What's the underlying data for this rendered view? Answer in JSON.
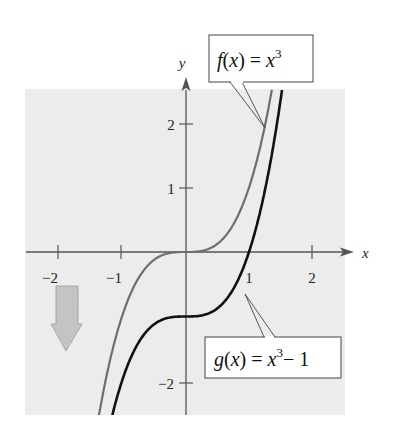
{
  "chart_data": {
    "type": "line",
    "title": "",
    "xlabel": "x",
    "ylabel": "y",
    "xlim": [
      -2.5,
      2.5
    ],
    "ylim": [
      -2.55,
      2.55
    ],
    "grid": false,
    "x_ticks": [
      -2,
      -1,
      1,
      2
    ],
    "x_tick_labels": [
      "−2",
      "−1",
      "1",
      "2"
    ],
    "y_ticks": [
      -2,
      1,
      2
    ],
    "y_tick_labels": [
      "−2",
      "1",
      "2"
    ],
    "series": [
      {
        "name": "f(x) = x^3",
        "color": "#6e6e6e",
        "x": [
          -1.4,
          -1.2,
          -1.0,
          -0.8,
          -0.6,
          -0.4,
          -0.2,
          0,
          0.2,
          0.4,
          0.6,
          0.8,
          1.0,
          1.2,
          1.36
        ],
        "values": [
          -2.744,
          -1.728,
          -1.0,
          -0.512,
          -0.216,
          -0.064,
          -0.008,
          0,
          0.008,
          0.064,
          0.216,
          0.512,
          1.0,
          1.728,
          2.515
        ]
      },
      {
        "name": "g(x) = x^3 − 1",
        "color": "#111111",
        "x": [
          -1.2,
          -1.0,
          -0.8,
          -0.6,
          -0.4,
          -0.2,
          0,
          0.2,
          0.4,
          0.6,
          0.8,
          1.0,
          1.2,
          1.4,
          1.52
        ],
        "values": [
          -2.728,
          -2.0,
          -1.512,
          -1.216,
          -1.064,
          -1.008,
          -1.0,
          -0.992,
          -0.936,
          -0.784,
          -0.488,
          0,
          0.728,
          1.744,
          2.512
        ]
      }
    ],
    "annotations": [
      {
        "text": "f(x) = x^3",
        "points_to": "f curve near (1.25, 2)"
      },
      {
        "text": "g(x) = x^3 − 1",
        "points_to": "g curve near (0.87, -0.35)"
      },
      {
        "text": "downward arrow",
        "meaning": "vertical shift down by 1 unit"
      }
    ],
    "colors": {
      "plot_background": "#ececec",
      "axis": "#555555",
      "f_curve": "#6e6e6e",
      "g_curve": "#111111",
      "shift_arrow": "#c4c4c4"
    }
  },
  "labels": {
    "x_axis": "x",
    "y_axis": "y",
    "f_label": {
      "fn": "f",
      "arg": "x",
      "eq": "=",
      "base": "x",
      "exp": "3"
    },
    "g_label": {
      "fn": "g",
      "arg": "x",
      "eq": "=",
      "base": "x",
      "exp": "3",
      "tail": "− 1"
    },
    "ticks": {
      "xm2": "−2",
      "xm1": "−1",
      "x1": "1",
      "x2": "2",
      "y2": "2",
      "y1": "1",
      "ym2": "−2"
    }
  }
}
